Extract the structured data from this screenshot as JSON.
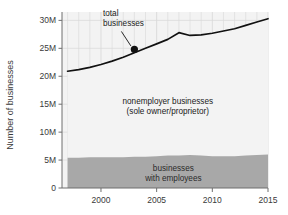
{
  "chart_data": {
    "type": "area",
    "title": "",
    "xlabel": "",
    "ylabel": "Number of businesses",
    "xlim": [
      1996.5,
      2015.0
    ],
    "ylim": [
      0,
      31.5
    ],
    "grid": true,
    "legend_position": "inline-annotations",
    "x_ticks": [
      "2000",
      "2005",
      "2010",
      "2015"
    ],
    "x_tick_values": [
      2000,
      2005,
      2010,
      2015
    ],
    "y_ticks": [
      "0",
      "5M",
      "10M",
      "15M",
      "20M",
      "25M",
      "30M"
    ],
    "y_tick_values": [
      0,
      5,
      10,
      15,
      20,
      25,
      30
    ],
    "x": [
      1997,
      1998,
      1999,
      2000,
      2001,
      2002,
      2003,
      2004,
      2005,
      2006,
      2007,
      2008,
      2009,
      2010,
      2011,
      2012,
      2013,
      2014,
      2015
    ],
    "series": [
      {
        "name": "total businesses",
        "type": "line",
        "color": "#111111",
        "values": [
          20.9,
          21.2,
          21.6,
          22.1,
          22.7,
          23.4,
          24.2,
          25.0,
          25.8,
          26.6,
          27.8,
          27.3,
          27.4,
          27.7,
          28.1,
          28.5,
          29.1,
          29.7,
          30.3
        ]
      },
      {
        "name": "businesses with employees",
        "type": "area",
        "color": "#a8a8a8",
        "values": [
          5.4,
          5.4,
          5.5,
          5.5,
          5.5,
          5.5,
          5.6,
          5.6,
          5.7,
          5.8,
          5.8,
          5.9,
          5.8,
          5.7,
          5.7,
          5.7,
          5.8,
          5.9,
          6.0
        ]
      },
      {
        "name": "nonemployer businesses (sole owner/proprietor)",
        "type": "area",
        "color": "#f2f2f2",
        "values": [
          15.5,
          15.8,
          16.1,
          16.6,
          17.2,
          17.9,
          18.6,
          19.4,
          20.1,
          20.8,
          22.0,
          21.4,
          21.6,
          22.0,
          22.4,
          22.8,
          23.3,
          23.8,
          24.3
        ]
      }
    ],
    "annotations": [
      {
        "name": "total-businesses-callout",
        "text_line1": "total",
        "text_line2": "businesses",
        "point_x": 2003.0,
        "point_y": 24.8,
        "marker": "filled-circle"
      },
      {
        "name": "nonemployer-label",
        "text_line1": "nonemployer businesses",
        "text_line2": "(sole owner/proprietor)",
        "at_x": 2006.0,
        "at_y": 15.0
      },
      {
        "name": "employer-label",
        "text_line1": "businesses",
        "text_line2": "with employees",
        "at_x": 2006.5,
        "at_y": 3.0
      }
    ],
    "colors": {
      "line": "#111111",
      "employer_band": "#a8a8a8",
      "nonemployer_band": "#f3f3f3",
      "grid": "#d9d9d9",
      "axis": "#6f6f6f",
      "text": "#333333"
    }
  }
}
